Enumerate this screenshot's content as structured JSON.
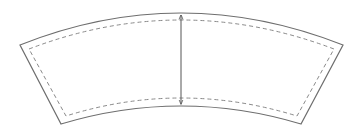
{
  "diagram": {
    "title": "",
    "shape": "arc-segment-cup-sleeve-template",
    "colors": {
      "background": "#ffffff",
      "outline": "#6e6e6e",
      "dashed_outline": "#8a8a8a",
      "arrow": "#555555"
    },
    "outer_outline": {
      "top_left": [
        20,
        45
      ],
      "top_center": [
        181,
        13
      ],
      "top_right": [
        343,
        45
      ],
      "bottom_right": [
        301,
        124
      ],
      "bottom_center": [
        181,
        106
      ],
      "bottom_left": [
        61,
        124
      ]
    },
    "inner_dashed_outline": {
      "top_left": [
        29,
        49
      ],
      "top_center": [
        181,
        20
      ],
      "top_right": [
        334,
        49
      ],
      "bottom_right": [
        297,
        116
      ],
      "bottom_center": [
        181,
        98
      ],
      "bottom_left": [
        66,
        116
      ],
      "dash": "4 3"
    },
    "height_arrow": {
      "x": 181,
      "y_top": 15,
      "y_bottom": 104,
      "double_headed": true
    },
    "labels": []
  }
}
